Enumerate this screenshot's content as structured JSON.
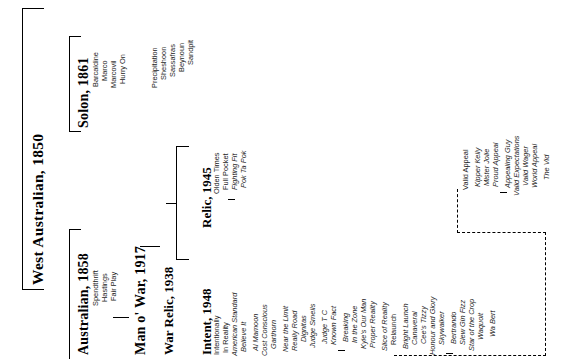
{
  "diagram": {
    "kind": "pedigree-tree",
    "orientation": "rotated-90-left",
    "title_visible": false
  },
  "generations": {
    "g1": {
      "label": "West Australian, 1850"
    },
    "g2": [
      {
        "label": "Solon, 1861"
      },
      {
        "label": "Australian, 1858"
      }
    ],
    "g3": [
      {
        "label": "Man o' War, 1917"
      }
    ],
    "g4": [
      {
        "label": "War Relic, 1938"
      }
    ],
    "g5": [
      {
        "label": "Relic, 1945"
      },
      {
        "label": "Intent, 1948"
      }
    ]
  },
  "offspring": {
    "solon": [
      "Barcaldine",
      "Marco",
      "Marcovil",
      "Hurry On"
    ],
    "hurry_on_line": [
      "Precipitation",
      "Sheshoon",
      "Sassafras",
      "Beynoun",
      "Sandpit"
    ],
    "australian": [
      "Spendthrift",
      "Hastings",
      "Fair Play"
    ],
    "relic_1945": [
      "Olden Times",
      "Full Pocket",
      "Fighting Fit",
      "Pok Ta Pok"
    ],
    "intent_1948": [
      "Intentionally",
      "In Reality",
      "American Standard",
      "Believe It",
      "Al Mamoon",
      "Cost Conscious",
      "Garthorn",
      "Near the Limit",
      "Really Road",
      "Dignitas",
      "Judge Smells",
      "Judge T C",
      "Known Fact",
      "Breaking",
      "In the Zone",
      "Kyle's Our Man",
      "Proper Reality",
      "Slice of Reality",
      "Relaunch",
      "Bright Launch",
      "Canaveral",
      "Cee's Tizzy",
      "Honour and Glory",
      "Skywalker",
      "Bertrando",
      "Slew Gin Fizz",
      "Star of the Crop",
      "Waquoit",
      "Wa Bert"
    ],
    "valid_appeal_branch": [
      "Valid Appeal",
      "Kipper Kelly",
      "Mister Jolie",
      "Proud Appeal",
      "Appealing Guy",
      "Valid Expectations",
      "Valid Wager",
      "World Appeal",
      "The Vid"
    ]
  },
  "styles": {
    "bold_names": [
      "West Australian, 1850",
      "Solon, 1861",
      "Australian, 1858",
      "Man o' War, 1917",
      "War Relic, 1938",
      "Relic, 1945",
      "Intent, 1948"
    ],
    "italic_offspring": [
      "American Standard",
      "Believe It",
      "Al Mamoon",
      "Cost Conscious",
      "Garthorn",
      "Near the Limit",
      "Really Road",
      "Dignitas",
      "Judge Smells",
      "Judge T C",
      "Known Fact",
      "Breaking",
      "In the Zone",
      "Kyle's Our Man",
      "Proper Reality",
      "Slice of Reality",
      "Bright Launch",
      "Canaveral",
      "Cee's Tizzy",
      "Honour and Glory",
      "Skywalker",
      "Bertrando",
      "Slew Gin Fizz",
      "Star of the Crop",
      "Waquoit",
      "Wa Bert",
      "Fighting Fit",
      "Pok Ta Pok",
      "Appealing Guy",
      "Valid Expectations",
      "Valid Wager",
      "World Appeal",
      "The Vid"
    ],
    "line_color": "#000000",
    "text_color": "#1c1c1c",
    "background": "#ffffff"
  }
}
